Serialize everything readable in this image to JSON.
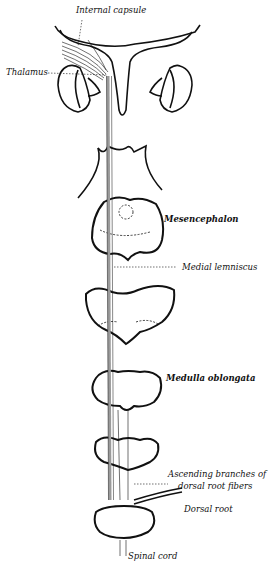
{
  "diagram": {
    "labels": {
      "internal_capsule": "Internal capsule",
      "thalamus": "Thalamus",
      "mesencephalon": "Mesencephalon",
      "medial_lemniscus": "Medial lemniscus",
      "medulla_oblongata": "Medulla oblongata",
      "ascending_branches_1": "Ascending branches of",
      "ascending_branches_2": "dorsal root fibers",
      "dorsal_root": "Dorsal root",
      "spinal_cord": "Spinal cord"
    },
    "colors": {
      "ink": "#111111",
      "tract": "#9a9a9a",
      "background": "#ffffff"
    }
  }
}
